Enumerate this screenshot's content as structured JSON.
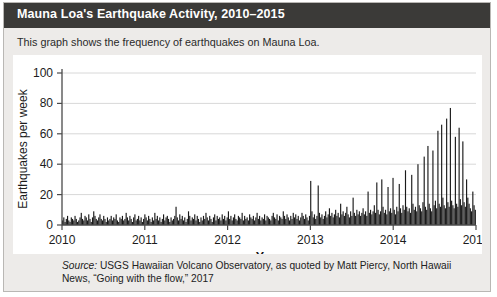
{
  "header": {
    "title": "Mauna Loa's Earthquake Activity, 2010–2015",
    "bg_color": "#3b3a38",
    "text_color": "#ffffff"
  },
  "subtitle": "This graph shows the frequency of earthquakes on Mauna Loa.",
  "source": {
    "label": "Source:",
    "text": " USGS Hawaiian Volcano Observatory, as quoted by Matt Piercy, North Hawaii News, “Going with the flow,” 2017"
  },
  "chart_data": {
    "type": "bar",
    "title": "Mauna Loa's Earthquake Activity, 2010–2015",
    "xlabel": "Year",
    "ylabel": "Earthquakes per week",
    "xlim": [
      2010,
      2015
    ],
    "ylim": [
      0,
      100
    ],
    "grid": true,
    "legend": "none",
    "bar_color": "#1a1a1a",
    "xticks": [
      "2010",
      "2011",
      "2012",
      "2013",
      "2014",
      "2015"
    ],
    "yticks": [
      "0",
      "20",
      "40",
      "60",
      "80",
      "100"
    ],
    "x_start": 2010,
    "x_step": 0.019230769,
    "values": [
      3,
      5,
      2,
      4,
      6,
      3,
      2,
      5,
      4,
      3,
      6,
      4,
      2,
      3,
      5,
      8,
      4,
      3,
      6,
      5,
      3,
      7,
      4,
      2,
      5,
      9,
      6,
      4,
      3,
      5,
      7,
      4,
      3,
      6,
      4,
      2,
      5,
      3,
      4,
      6,
      3,
      5,
      4,
      7,
      3,
      2,
      5,
      4,
      6,
      3,
      4,
      8,
      5,
      3,
      6,
      4,
      2,
      5,
      7,
      3,
      4,
      6,
      3,
      5,
      2,
      4,
      7,
      5,
      3,
      6,
      4,
      2,
      5,
      3,
      8,
      4,
      6,
      3,
      5,
      2,
      4,
      7,
      3,
      5,
      6,
      4,
      2,
      5,
      3,
      4,
      6,
      12,
      5,
      3,
      7,
      4,
      6,
      3,
      5,
      2,
      4,
      9,
      6,
      3,
      5,
      4,
      7,
      3,
      6,
      4,
      2,
      5,
      3,
      6,
      4,
      8,
      5,
      3,
      6,
      4,
      2,
      5,
      7,
      3,
      6,
      4,
      5,
      3,
      7,
      4,
      6,
      3,
      5,
      9,
      4,
      6,
      3,
      5,
      7,
      4,
      3,
      6,
      5,
      4,
      8,
      3,
      6,
      4,
      5,
      3,
      7,
      5,
      4,
      6,
      3,
      5,
      8,
      4,
      6,
      3,
      5,
      4,
      7,
      3,
      6,
      5,
      4,
      3,
      6,
      8,
      5,
      4,
      7,
      3,
      6,
      5,
      4,
      9,
      6,
      4,
      7,
      5,
      3,
      6,
      4,
      8,
      5,
      7,
      4,
      6,
      3,
      5,
      8,
      6,
      4,
      7,
      5,
      3,
      6,
      29,
      9,
      5,
      7,
      4,
      6,
      26,
      8,
      5,
      7,
      4,
      6,
      9,
      5,
      7,
      11,
      6,
      8,
      5,
      7,
      10,
      6,
      8,
      5,
      14,
      7,
      9,
      6,
      8,
      12,
      7,
      5,
      9,
      6,
      18,
      8,
      6,
      10,
      7,
      9,
      6,
      8,
      11,
      7,
      9,
      6,
      22,
      8,
      10,
      7,
      9,
      13,
      8,
      28,
      10,
      7,
      9,
      30,
      12,
      8,
      10,
      7,
      25,
      9,
      11,
      8,
      31,
      10,
      7,
      12,
      9,
      27,
      11,
      8,
      13,
      10,
      36,
      12,
      9,
      11,
      8,
      33,
      14,
      10,
      12,
      9,
      40,
      13,
      11,
      9,
      15,
      45,
      12,
      10,
      52,
      14,
      11,
      9,
      49,
      13,
      16,
      11,
      62,
      14,
      12,
      66,
      18,
      13,
      11,
      70,
      15,
      12,
      77,
      16,
      13,
      11,
      58,
      14,
      12,
      64,
      17,
      13,
      55,
      15,
      12,
      30,
      18,
      14,
      11,
      9,
      22,
      13,
      10
    ]
  }
}
